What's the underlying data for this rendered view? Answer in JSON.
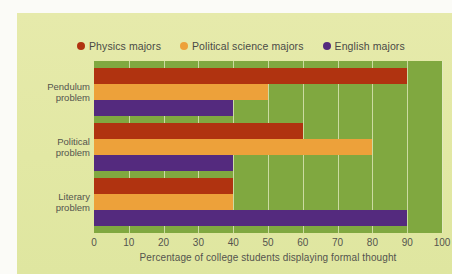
{
  "figure": {
    "background_color": "#e4e9a8",
    "plot_background_color": "#80a840"
  },
  "legend": {
    "position": "top",
    "items": [
      {
        "label": "Physics majors",
        "color": "#b03310",
        "swatch": "dot-icon"
      },
      {
        "label": "Political science majors",
        "color": "#eda13a",
        "swatch": "dot-icon"
      },
      {
        "label": "English majors",
        "color": "#542a7e",
        "swatch": "dot-icon"
      }
    ]
  },
  "chart_data": {
    "type": "bar",
    "orientation": "horizontal",
    "title": "",
    "xlabel": "Percentage of college students displaying formal thought",
    "ylabel": "",
    "xlim": [
      0,
      100
    ],
    "xticks": [
      0,
      10,
      20,
      30,
      40,
      50,
      60,
      70,
      80,
      90,
      100
    ],
    "xtick_labels": [
      "0",
      "10",
      "20",
      "30",
      "40",
      "50",
      "60",
      "70",
      "80",
      "90",
      "100"
    ],
    "grid": "vertical",
    "legend_position": "top",
    "categories": [
      "Pendulum problem",
      "Political problem",
      "Literary problem"
    ],
    "category_lines": [
      [
        "Pendulum",
        "problem"
      ],
      [
        "Political",
        "problem"
      ],
      [
        "Literary",
        "problem"
      ]
    ],
    "series": [
      {
        "name": "Physics majors",
        "color": "#b03310",
        "values": [
          90,
          60,
          40
        ]
      },
      {
        "name": "Political science majors",
        "color": "#eda13a",
        "values": [
          50,
          80,
          40
        ]
      },
      {
        "name": "English majors",
        "color": "#542a7e",
        "values": [
          40,
          40,
          90
        ]
      }
    ]
  }
}
